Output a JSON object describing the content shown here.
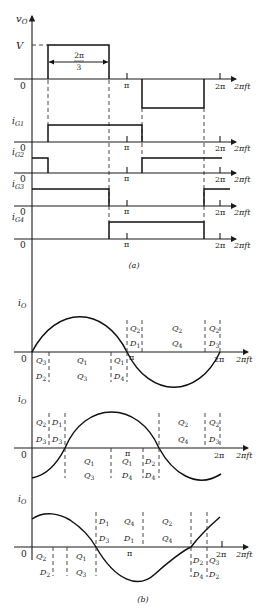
{
  "figure": {
    "panel_a": {
      "caption": "(a)",
      "vo": {
        "label": "v",
        "sub": "O",
        "level": "V",
        "width_num": "2π",
        "width_den": "3"
      },
      "gates": [
        {
          "label": "i",
          "sub": "G1"
        },
        {
          "label": "i",
          "sub": "G2"
        },
        {
          "label": "i",
          "sub": "G3"
        },
        {
          "label": "i",
          "sub": "G4"
        }
      ]
    },
    "panel_b": {
      "caption": "(b)",
      "current_label": "i",
      "current_sub": "O",
      "plot1": {
        "above": [
          "Q2",
          "Q2",
          "D1",
          "Q4",
          "Q2",
          "D3"
        ],
        "below": [
          "Q3",
          "D2",
          "Q1",
          "Q3",
          "Q1",
          "D4"
        ]
      },
      "plot2": {
        "above": [
          "Q2",
          "D1",
          "D3",
          "D3",
          "Q2",
          "Q4",
          "Q2",
          "D3"
        ],
        "below": [
          "Q1",
          "Q3",
          "Q1",
          "D4",
          "D2",
          "D4"
        ]
      },
      "plot3": {
        "above": [
          "D1",
          "Q4",
          "Q2",
          "D3",
          "D1",
          "Q4"
        ],
        "below": [
          "Q2",
          "D2",
          "Q1",
          "Q3",
          "D2",
          "D4",
          "Q3",
          "D2"
        ]
      }
    },
    "axis": {
      "zero": "0",
      "pi": "π",
      "two_pi": "2π",
      "xvar": "2πft"
    }
  }
}
